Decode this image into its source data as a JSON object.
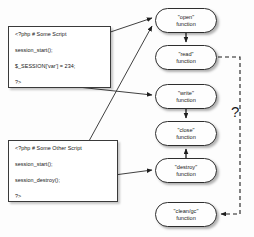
{
  "diagram": {
    "background_color": "#fdfdfd",
    "line_color": "#2e2e2e",
    "scripts": [
      {
        "name": "some-script",
        "lines": [
          "<?php # Some Script",
          "session_start();",
          "$_SESSION['var'] = 234;",
          "?>"
        ]
      },
      {
        "name": "some-other-script",
        "lines": [
          "<?php # Some Other Script",
          "session_start();",
          "session_destroy();",
          "?>"
        ]
      }
    ],
    "nodes": [
      {
        "id": "open",
        "line1": "\"open\"",
        "line2": "function"
      },
      {
        "id": "read",
        "line1": "\"read\"",
        "line2": "function"
      },
      {
        "id": "write",
        "line1": "\"write\"",
        "line2": "function"
      },
      {
        "id": "close",
        "line1": "\"close\"",
        "line2": "function"
      },
      {
        "id": "destroy",
        "line1": "\"destroy\"",
        "line2": "function"
      },
      {
        "id": "cleangc",
        "line1": "\"clean/gc\"",
        "line2": "function"
      }
    ],
    "annotations": {
      "question": "?"
    },
    "edges": [
      {
        "from": "some-script.session_start",
        "to": "open",
        "style": "solid"
      },
      {
        "from": "some-script.close_tag",
        "to": "write",
        "style": "solid"
      },
      {
        "from": "some-other-script.session_start",
        "to": "open",
        "style": "solid"
      },
      {
        "from": "some-other-script.session_destroy",
        "to": "destroy",
        "style": "solid"
      },
      {
        "from": "open",
        "to": "read",
        "style": "solid"
      },
      {
        "from": "write",
        "to": "close",
        "style": "solid"
      },
      {
        "from": "destroy",
        "to": "close",
        "style": "solid"
      },
      {
        "from": "read",
        "to": "cleangc",
        "style": "dashed"
      }
    ]
  }
}
